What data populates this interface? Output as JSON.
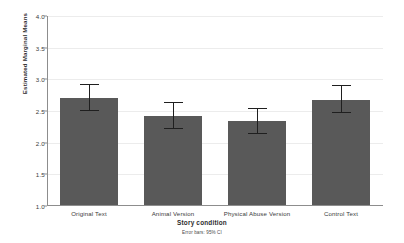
{
  "chart_data": {
    "type": "bar",
    "title": "",
    "xlabel": "Story condition",
    "ylabel": "Estimated Marginal Means",
    "categories": [
      "Original Text",
      "Animal Version",
      "Physical Abuse Version",
      "Control Text"
    ],
    "values": [
      2.71,
      2.42,
      2.34,
      2.68
    ],
    "error_low": [
      2.5,
      2.21,
      2.13,
      2.47
    ],
    "error_high": [
      2.93,
      2.64,
      2.55,
      2.91
    ],
    "ylim": [
      1.0,
      4.0
    ],
    "ytick_labels": [
      "1.0",
      "1.5",
      "2.0",
      "2.5",
      "3.0",
      "3.5",
      "4.0"
    ],
    "ytick_values": [
      1.0,
      1.5,
      2.0,
      2.5,
      3.0,
      3.5,
      4.0
    ],
    "grid": true,
    "legend": "none",
    "annotation": "Error bars: 95% CI",
    "bar_color": "#595959",
    "error_bar_color": "#1f1f1f",
    "grid_color": "#ececec",
    "axis_color": "#8d8d8d"
  },
  "axis": {
    "y_title": "Estimated Marginal Means",
    "x_title": "Story condition"
  },
  "footnote": {
    "text": "Error bars: 95% CI"
  },
  "ticks": {
    "y": [
      {
        "label": "4.0"
      },
      {
        "label": "3.5"
      },
      {
        "label": "3.0"
      },
      {
        "label": "2.5"
      },
      {
        "label": "2.0"
      },
      {
        "label": "1.5"
      },
      {
        "label": "1.0"
      }
    ]
  }
}
